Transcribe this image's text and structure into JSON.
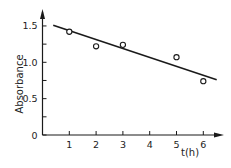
{
  "chart_data": {
    "type": "scatter",
    "title": "",
    "xlabel": "t(h)",
    "ylabel": "Absorbance",
    "xlim": [
      0,
      6.7
    ],
    "ylim": [
      0,
      1.6
    ],
    "x_ticks": [
      1,
      2,
      3,
      4,
      5,
      6
    ],
    "x_tick_labels": [
      "1",
      "2",
      "3",
      "4",
      "5",
      "6"
    ],
    "y_ticks": [
      0,
      0.5,
      1.0,
      1.5
    ],
    "y_tick_labels": [
      "0",
      "0.5",
      "1.0",
      "1.5"
    ],
    "y_minor_ticks": [
      0.25,
      0.75,
      1.25
    ],
    "grid": false,
    "legend": null,
    "series": [
      {
        "name": "measured",
        "kind": "scatter",
        "marker": "open-circle",
        "x": [
          1,
          2,
          3,
          5,
          6
        ],
        "y": [
          1.42,
          1.22,
          1.24,
          1.07,
          0.74
        ]
      },
      {
        "name": "fit",
        "kind": "line",
        "x": [
          0.4,
          6.5
        ],
        "y": [
          1.51,
          0.76
        ]
      }
    ]
  },
  "labels": {
    "xlabel": "t(h)",
    "ylabel": "Absorbance"
  },
  "colors": {
    "ink": "#1a1a1a",
    "background": "#ffffff"
  }
}
